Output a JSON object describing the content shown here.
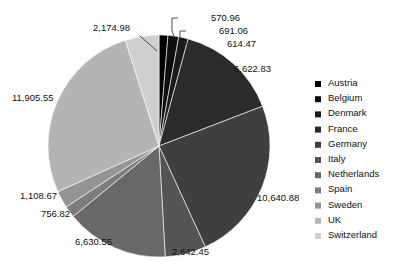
{
  "chart_data": {
    "type": "pie",
    "title": "",
    "subtitle": "",
    "xlabel": "",
    "ylabel": "",
    "grid": false,
    "legend_position": "right",
    "total": 54259.31,
    "categories": [
      "Austria",
      "Belgium",
      "Denmark",
      "France",
      "Germany",
      "Italy",
      "Netherlands",
      "Spain",
      "Sweden",
      "UK",
      "Switzerland"
    ],
    "values": [
      570.96,
      691.06,
      614.47,
      6622.83,
      10640.88,
      2642.45,
      6630.55,
      756.82,
      1108.67,
      11905.55,
      2174.98
    ],
    "value_labels": [
      "570.96",
      "691.06",
      "614.47",
      "6,622.83",
      "10,640.88",
      "2,642.45",
      "6,630.55",
      "756.82",
      "1,108.67",
      "11,905.55",
      "2,174.98"
    ],
    "colors": [
      "#000000",
      "#0d0d0d",
      "#1a1a1a",
      "#2b2b2b",
      "#3f3f3f",
      "#545454",
      "#686868",
      "#7d7d7d",
      "#949494",
      "#b4b4b4",
      "#cfcfcf"
    ],
    "slices": [
      {
        "name": "Austria",
        "value": 570.96,
        "label": "570.96",
        "color": "#000000",
        "label_x": 211,
        "label_y": 21,
        "anchor": "start",
        "leader": "M 178 18 L 172 18 L 172 31 L 174 36"
      },
      {
        "name": "Belgium",
        "value": 691.06,
        "label": "691.06",
        "color": "#0d0d0d",
        "label_x": 219,
        "label_y": 34,
        "anchor": "start",
        "leader": "M 186 31 L 180 31 L 180 38 L 179 38"
      },
      {
        "name": "Denmark",
        "value": 614.47,
        "label": "614.47",
        "color": "#1a1a1a",
        "label_x": 227,
        "label_y": 47,
        "anchor": "start",
        "leader": "M 194 44 L 188 44 L 188 44 L 184 42"
      },
      {
        "name": "France",
        "value": 6622.83,
        "label": "6,622.83",
        "color": "#2b2b2b",
        "label_x": 234,
        "label_y": 72,
        "anchor": "start",
        "leader": ""
      },
      {
        "name": "Germany",
        "value": 10640.88,
        "label": "10,640.88",
        "color": "#3f3f3f",
        "label_x": 257,
        "label_y": 201,
        "anchor": "start",
        "leader": ""
      },
      {
        "name": "Italy",
        "value": 2642.45,
        "label": "2,642.45",
        "color": "#545454",
        "label_x": 172,
        "label_y": 255,
        "anchor": "start",
        "leader": ""
      },
      {
        "name": "Netherlands",
        "value": 6630.55,
        "label": "6,630.55",
        "color": "#686868",
        "label_x": 75,
        "label_y": 245,
        "anchor": "start",
        "leader": ""
      },
      {
        "name": "Spain",
        "value": 756.82,
        "label": "756.82",
        "color": "#7d7d7d",
        "label_x": 41,
        "label_y": 217,
        "anchor": "start",
        "leader": ""
      },
      {
        "name": "Sweden",
        "value": 1108.67,
        "label": "1,108.67",
        "color": "#949494",
        "label_x": 20,
        "label_y": 199,
        "anchor": "start",
        "leader": ""
      },
      {
        "name": "UK",
        "value": 11905.55,
        "label": "11,905.55",
        "color": "#b4b4b4",
        "label_x": 12,
        "label_y": 101,
        "anchor": "start",
        "leader": ""
      },
      {
        "name": "Switzerland",
        "value": 2174.98,
        "label": "2,174.98",
        "color": "#cfcfcf",
        "label_x": 93,
        "label_y": 31,
        "anchor": "start",
        "leader": "M 140 36 L 157 51"
      }
    ],
    "legend": [
      {
        "label": "Austria",
        "color": "#000000"
      },
      {
        "label": "Belgium",
        "color": "#0d0d0d"
      },
      {
        "label": "Denmark",
        "color": "#1a1a1a"
      },
      {
        "label": "France",
        "color": "#2b2b2b"
      },
      {
        "label": "Germany",
        "color": "#3f3f3f"
      },
      {
        "label": "Italy",
        "color": "#545454"
      },
      {
        "label": "Netherlands",
        "color": "#686868"
      },
      {
        "label": "Spain",
        "color": "#7d7d7d"
      },
      {
        "label": "Sweden",
        "color": "#949494"
      },
      {
        "label": "UK",
        "color": "#b4b4b4"
      },
      {
        "label": "Switzerland",
        "color": "#cfcfcf"
      }
    ],
    "geometry": {
      "center_x": 159,
      "center_y": 146,
      "radius": 111,
      "start_angle_deg": -90,
      "direction": "clockwise"
    }
  }
}
